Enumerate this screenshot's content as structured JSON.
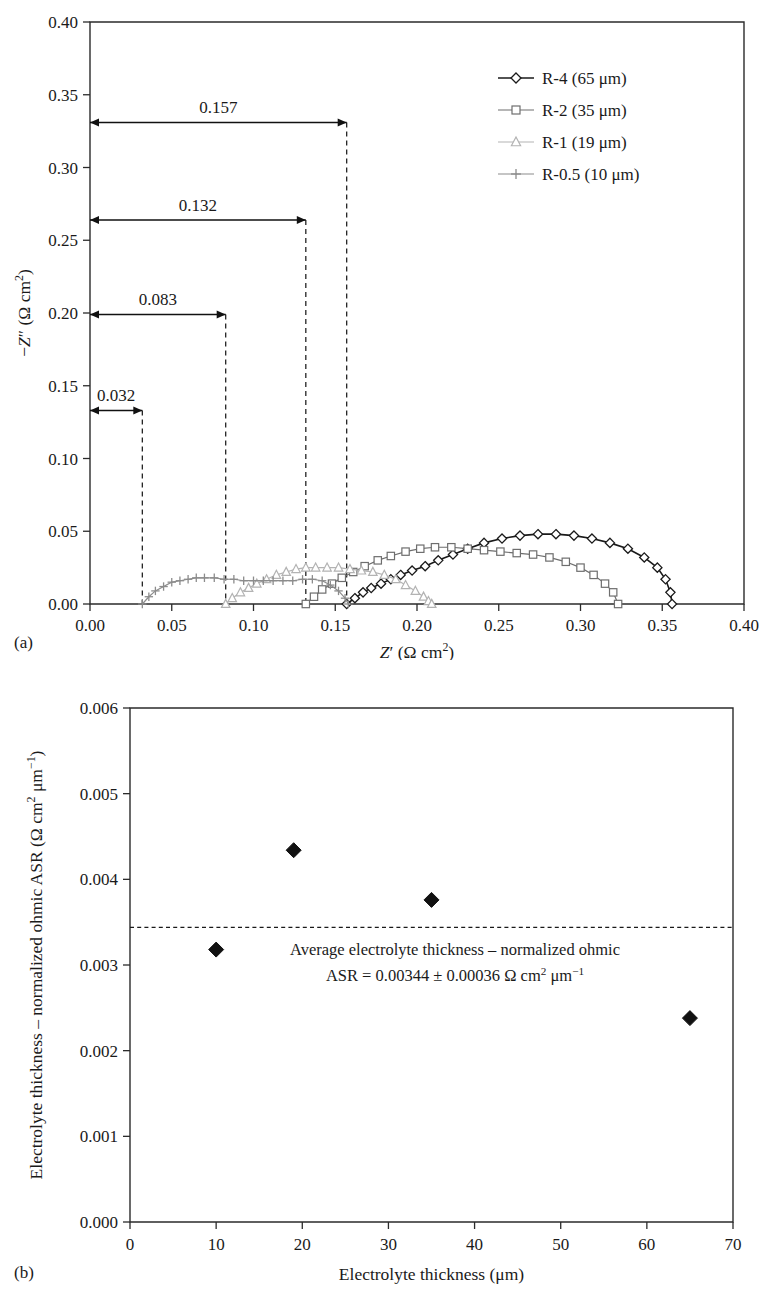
{
  "figure": {
    "panel_a_tag": "(a)",
    "panel_b_tag": "(b)"
  },
  "chart_data": [
    {
      "id": "nyquist",
      "type": "line",
      "title": "",
      "xlabel": "Z′ (Ω cm²)",
      "ylabel": "−Z″ (Ω cm²)",
      "xlim": [
        0.0,
        0.4
      ],
      "ylim": [
        0.0,
        0.4
      ],
      "xticks": [
        0.0,
        0.05,
        0.1,
        0.15,
        0.2,
        0.25,
        0.3,
        0.35,
        0.4
      ],
      "yticks": [
        0.0,
        0.05,
        0.1,
        0.15,
        0.2,
        0.25,
        0.3,
        0.35,
        0.4
      ],
      "xtick_labels": [
        "0.00",
        "0.05",
        "0.10",
        "0.15",
        "0.20",
        "0.25",
        "0.30",
        "0.35",
        "0.40"
      ],
      "ytick_labels": [
        "0.00",
        "0.05",
        "0.10",
        "0.15",
        "0.20",
        "0.25",
        "0.30",
        "0.35",
        "0.40"
      ],
      "grid": false,
      "legend_position": "top-right",
      "legend": [
        {
          "name": "R-4 (65 μm)",
          "marker": "diamond",
          "color": "#1a1a1a"
        },
        {
          "name": "R-2 (35 μm)",
          "marker": "square",
          "color": "#6e6e6e"
        },
        {
          "name": "R-1 (19 μm)",
          "marker": "triangle",
          "color": "#b3b3b3"
        },
        {
          "name": "R-0.5 (10 μm)",
          "marker": "plus",
          "color": "#8c8c8c"
        }
      ],
      "series": [
        {
          "name": "R-4 (65 μm)",
          "marker": "diamond",
          "color": "#1a1a1a",
          "intercept_low": 0.157,
          "intercept_high": 0.356,
          "peak": 0.048,
          "x": [
            0.157,
            0.162,
            0.167,
            0.172,
            0.178,
            0.184,
            0.19,
            0.197,
            0.205,
            0.213,
            0.222,
            0.231,
            0.241,
            0.252,
            0.263,
            0.274,
            0.285,
            0.296,
            0.307,
            0.318,
            0.329,
            0.339,
            0.347,
            0.352,
            0.355,
            0.356
          ],
          "y": [
            0.0,
            0.004,
            0.008,
            0.011,
            0.014,
            0.017,
            0.02,
            0.023,
            0.026,
            0.03,
            0.034,
            0.038,
            0.042,
            0.045,
            0.047,
            0.048,
            0.048,
            0.047,
            0.045,
            0.042,
            0.038,
            0.032,
            0.025,
            0.017,
            0.008,
            0.0
          ]
        },
        {
          "name": "R-2 (35 μm)",
          "marker": "square",
          "color": "#6e6e6e",
          "intercept_low": 0.132,
          "intercept_high": 0.323,
          "peak": 0.039,
          "x": [
            0.132,
            0.137,
            0.142,
            0.148,
            0.154,
            0.161,
            0.168,
            0.176,
            0.184,
            0.193,
            0.202,
            0.211,
            0.221,
            0.231,
            0.241,
            0.251,
            0.261,
            0.271,
            0.281,
            0.291,
            0.3,
            0.308,
            0.315,
            0.32,
            0.323
          ],
          "y": [
            0.0,
            0.005,
            0.01,
            0.014,
            0.018,
            0.022,
            0.026,
            0.03,
            0.033,
            0.036,
            0.038,
            0.039,
            0.039,
            0.038,
            0.037,
            0.036,
            0.035,
            0.034,
            0.032,
            0.029,
            0.025,
            0.02,
            0.014,
            0.008,
            0.0
          ]
        },
        {
          "name": "R-1 (19 μm)",
          "marker": "triangle",
          "color": "#b3b3b3",
          "intercept_low": 0.083,
          "intercept_high": 0.209,
          "peak": 0.025,
          "x": [
            0.083,
            0.087,
            0.092,
            0.097,
            0.102,
            0.108,
            0.114,
            0.12,
            0.126,
            0.132,
            0.138,
            0.145,
            0.152,
            0.159,
            0.166,
            0.173,
            0.18,
            0.187,
            0.193,
            0.199,
            0.204,
            0.207,
            0.209
          ],
          "y": [
            0.0,
            0.004,
            0.008,
            0.011,
            0.014,
            0.017,
            0.02,
            0.022,
            0.024,
            0.025,
            0.025,
            0.025,
            0.025,
            0.024,
            0.023,
            0.022,
            0.02,
            0.017,
            0.013,
            0.009,
            0.005,
            0.002,
            0.0
          ]
        },
        {
          "name": "R-0.5 (10 μm)",
          "marker": "plus",
          "color": "#8c8c8c",
          "intercept_low": 0.032,
          "intercept_high": 0.158,
          "peak": 0.018,
          "x": [
            0.032,
            0.036,
            0.04,
            0.045,
            0.05,
            0.055,
            0.06,
            0.065,
            0.07,
            0.076,
            0.082,
            0.088,
            0.094,
            0.1,
            0.106,
            0.112,
            0.118,
            0.124,
            0.13,
            0.136,
            0.142,
            0.147,
            0.152,
            0.156,
            0.158
          ],
          "y": [
            0.0,
            0.005,
            0.009,
            0.012,
            0.015,
            0.016,
            0.017,
            0.018,
            0.018,
            0.018,
            0.017,
            0.017,
            0.016,
            0.016,
            0.016,
            0.016,
            0.016,
            0.016,
            0.017,
            0.017,
            0.016,
            0.013,
            0.009,
            0.004,
            0.0
          ]
        }
      ],
      "annotations": [
        {
          "label": "0.157",
          "x_start": 0.0,
          "x_end": 0.157,
          "y": 0.331
        },
        {
          "label": "0.132",
          "x_start": 0.0,
          "x_end": 0.132,
          "y": 0.264
        },
        {
          "label": "0.083",
          "x_start": 0.0,
          "x_end": 0.083,
          "y": 0.199
        },
        {
          "label": "0.032",
          "x_start": 0.0,
          "x_end": 0.032,
          "y": 0.133
        }
      ],
      "dropline_x": [
        0.032,
        0.083,
        0.132,
        0.157
      ]
    },
    {
      "id": "ohmic-asr",
      "type": "scatter",
      "title": "",
      "xlabel": "Electrolyte thickness (μm)",
      "ylabel": "Electrolyte thickness – normalized ohmic ASR (Ω cm² μm⁻¹)",
      "xlim": [
        0,
        70
      ],
      "ylim": [
        0.0,
        0.006
      ],
      "xticks": [
        0,
        10,
        20,
        30,
        40,
        50,
        60,
        70
      ],
      "yticks": [
        0.0,
        0.001,
        0.002,
        0.003,
        0.004,
        0.005,
        0.006
      ],
      "xtick_labels": [
        "0",
        "10",
        "20",
        "30",
        "40",
        "50",
        "60",
        "70"
      ],
      "ytick_labels": [
        "0.000",
        "0.001",
        "0.002",
        "0.003",
        "0.004",
        "0.005",
        "0.006"
      ],
      "grid": false,
      "marker": "filled-diamond",
      "marker_color": "#111111",
      "x": [
        10,
        19,
        35,
        65
      ],
      "y": [
        0.00318,
        0.00434,
        0.00376,
        0.00238
      ],
      "average_line": {
        "value": 0.00344,
        "style": "dashed"
      },
      "annotation_line1": "Average electrolyte thickness – normalized ohmic",
      "annotation_line2_prefix": "ASR = 0.00344 ± 0.00036 Ω cm",
      "annotation_line2_sup1": "2",
      "annotation_line2_mid": " μm",
      "annotation_line2_sup2": "−1"
    }
  ]
}
